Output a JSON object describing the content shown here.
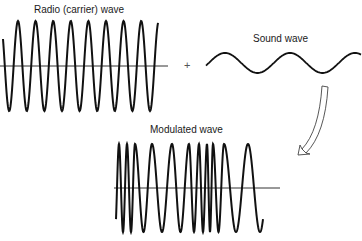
{
  "labels": {
    "carrier": "Radio (carrier) wave",
    "sound": "Sound wave",
    "modulated": "Modulated wave",
    "plus": "+"
  },
  "colors": {
    "stroke": "#111111",
    "axis": "#333333",
    "arrow": "#444444",
    "background": "#ffffff"
  },
  "diagram": {
    "carrier_wave": {
      "axis": {
        "x1": 0,
        "x2": 168,
        "y": 66
      },
      "x_start": 3,
      "x_end": 158,
      "amplitude": 45,
      "period": 17.6,
      "first_peak_x": 18
    },
    "sound_wave": {
      "x_start": 206,
      "x_end": 361,
      "center_y": 63,
      "amplitude": 10,
      "period": 65,
      "first_peak_x": 225
    },
    "modulated_wave": {
      "axis": {
        "x1": 114,
        "x2": 280,
        "y": 188
      },
      "amplitude": 44,
      "x_start": 116,
      "x_end": 263,
      "peak_x": [
        119,
        127,
        135,
        152,
        172,
        189,
        199,
        207,
        213,
        224,
        248
      ]
    },
    "arrow": {
      "from": [
        325,
        86
      ],
      "to": [
        298,
        155
      ]
    }
  }
}
